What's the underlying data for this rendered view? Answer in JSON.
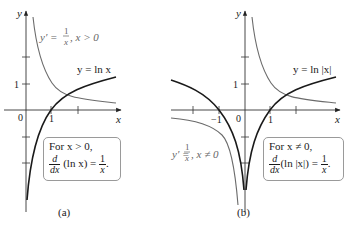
{
  "panels": [
    {
      "id": "a",
      "caption": "(a)",
      "axis": {
        "x_label": "x",
        "y_label": "y",
        "origin_label": "0",
        "x_tick_label": "1",
        "y_tick_label": "1"
      },
      "curve_labels": {
        "derivative": {
          "lhs": "y′ = ",
          "num": "1",
          "den": "x",
          "rhs": ", x > 0"
        },
        "function": "y = ln x"
      },
      "box": {
        "line1": "For x > 0,",
        "d": "d",
        "dx": "dx",
        "expr": "(ln x) = ",
        "num": "1",
        "den": "x",
        "end": "."
      }
    },
    {
      "id": "b",
      "caption": "(b)",
      "axis": {
        "x_label": "x",
        "y_label": "y",
        "origin_label": "0",
        "x_tick_label": "1",
        "x_neg_tick_label": "−1",
        "y_tick_label": "1"
      },
      "curve_labels": {
        "derivative": {
          "lhs": "y′ = ",
          "num": "1",
          "den": "x",
          "rhs": ", x ≠ 0"
        },
        "function": "y = ln |x|"
      },
      "box": {
        "line1": "For x ≠ 0,",
        "d": "d",
        "dx": "dx",
        "expr": "(ln |x|) = ",
        "num": "1",
        "den": "x",
        "end": "."
      }
    }
  ],
  "colors": {
    "function_curve": "#1a1a1a",
    "derivative_curve": "#6b6b6b",
    "axis": "#333333",
    "box_border": "#9a9a9a"
  }
}
